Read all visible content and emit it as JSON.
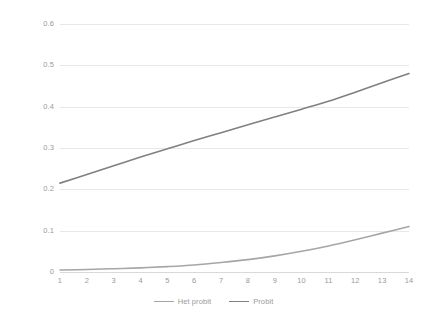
{
  "chart_data": {
    "type": "line",
    "title": "",
    "subtitle": "",
    "xlabel": "",
    "ylabel": "",
    "xlim": [
      1,
      14
    ],
    "ylim": [
      0,
      0.6
    ],
    "grid": true,
    "legend_position": "bottom-center",
    "x": [
      1,
      2,
      3,
      4,
      5,
      6,
      7,
      8,
      9,
      10,
      11,
      12,
      13,
      14
    ],
    "x_tick_labels": [
      "1",
      "2",
      "3",
      "4",
      "5",
      "6",
      "7",
      "8",
      "9",
      "10",
      "11",
      "12",
      "13",
      "14"
    ],
    "y_tick_labels": [
      "0",
      "0.1",
      "0.2",
      "0.3",
      "0.4",
      "0.5",
      "0.6"
    ],
    "y_ticks": [
      0,
      0.1,
      0.2,
      0.3,
      0.4,
      0.5,
      0.6
    ],
    "series": [
      {
        "name": "Het probit",
        "color": "#a6a6a6",
        "values": [
          0.005,
          0.006,
          0.008,
          0.01,
          0.013,
          0.017,
          0.023,
          0.03,
          0.039,
          0.05,
          0.063,
          0.078,
          0.094,
          0.11
        ]
      },
      {
        "name": "Probit",
        "color": "#808080",
        "values": [
          0.215,
          0.236,
          0.257,
          0.278,
          0.298,
          0.318,
          0.337,
          0.356,
          0.375,
          0.394,
          0.413,
          0.435,
          0.458,
          0.48
        ]
      }
    ]
  },
  "colors": {
    "background": "#ffffff",
    "gridline": "#e8e8e8",
    "axis": "#d9d9d9",
    "tick_text": "#9a9a9a",
    "series_het_probit": "#a6a6a6",
    "series_probit": "#808080"
  }
}
